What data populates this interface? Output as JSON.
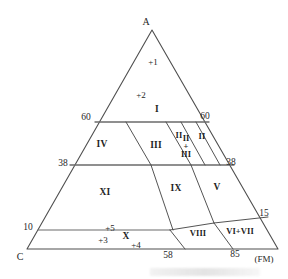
{
  "figure": {
    "type": "ternary-phase-diagram",
    "background_color": "#ffffff",
    "line_color": "#4a4a4a"
  },
  "vertices": {
    "top": "A",
    "bottom_left": "C",
    "bottom_right_note": "(FM)"
  },
  "axis_labels": {
    "left_60": "60",
    "right_60": "60",
    "left_38": "38",
    "right_38": "38",
    "left_10": "10",
    "right_15": "15",
    "bottom_58": "58",
    "bottom_85": "85"
  },
  "regions": [
    {
      "id": "I",
      "label": "I",
      "x": 157,
      "y": 110,
      "size": "normal"
    },
    {
      "id": "IV",
      "label": "IV",
      "x": 102,
      "y": 145,
      "size": "normal"
    },
    {
      "id": "III",
      "label": "III",
      "x": 156,
      "y": 146,
      "size": "normal"
    },
    {
      "id": "II_a",
      "label": "II",
      "x": 179,
      "y": 135,
      "size": "small"
    },
    {
      "id": "II_b",
      "label": "II",
      "x": 202,
      "y": 136,
      "size": "small"
    },
    {
      "id": "XI",
      "label": "XI",
      "x": 105,
      "y": 193,
      "size": "normal"
    },
    {
      "id": "IX",
      "label": "IX",
      "x": 176,
      "y": 189,
      "size": "normal"
    },
    {
      "id": "V",
      "label": "V",
      "x": 217,
      "y": 188,
      "size": "normal"
    },
    {
      "id": "VIII",
      "label": "VIII",
      "x": 198,
      "y": 233,
      "size": "small"
    },
    {
      "id": "VI_VII",
      "label": "VI+VII",
      "x": 240,
      "y": 231,
      "size": "small"
    },
    {
      "id": "X",
      "label": "X",
      "x": 126,
      "y": 237,
      "size": "normal"
    }
  ],
  "stacked_region": {
    "id": "II_plus_III",
    "lines": [
      "II",
      "+",
      "III"
    ],
    "x": 186,
    "y": 146
  },
  "data_points": [
    {
      "label": "+1",
      "x": 153,
      "y": 62
    },
    {
      "label": "+2",
      "x": 141,
      "y": 95
    },
    {
      "label": "+5",
      "x": 110,
      "y": 228
    },
    {
      "label": "+3",
      "x": 103,
      "y": 240
    },
    {
      "label": "+4",
      "x": 136,
      "y": 245
    }
  ],
  "chart_data": {
    "type": "ternary-diagram",
    "title": "",
    "apex_labels": {
      "top": "A",
      "left": "C",
      "right": "(FM)"
    },
    "left_axis_ticks": [
      60,
      38,
      10
    ],
    "right_axis_ticks": [
      60,
      38,
      15
    ],
    "bottom_axis_ticks": [
      58,
      85
    ],
    "field_labels": [
      "I",
      "II",
      "III",
      "II + III",
      "IV",
      "V",
      "VI+VII",
      "VIII",
      "IX",
      "X",
      "XI"
    ],
    "plotted_points": [
      "+1",
      "+2",
      "+3",
      "+4",
      "+5"
    ],
    "grid": false,
    "legend": "none"
  }
}
